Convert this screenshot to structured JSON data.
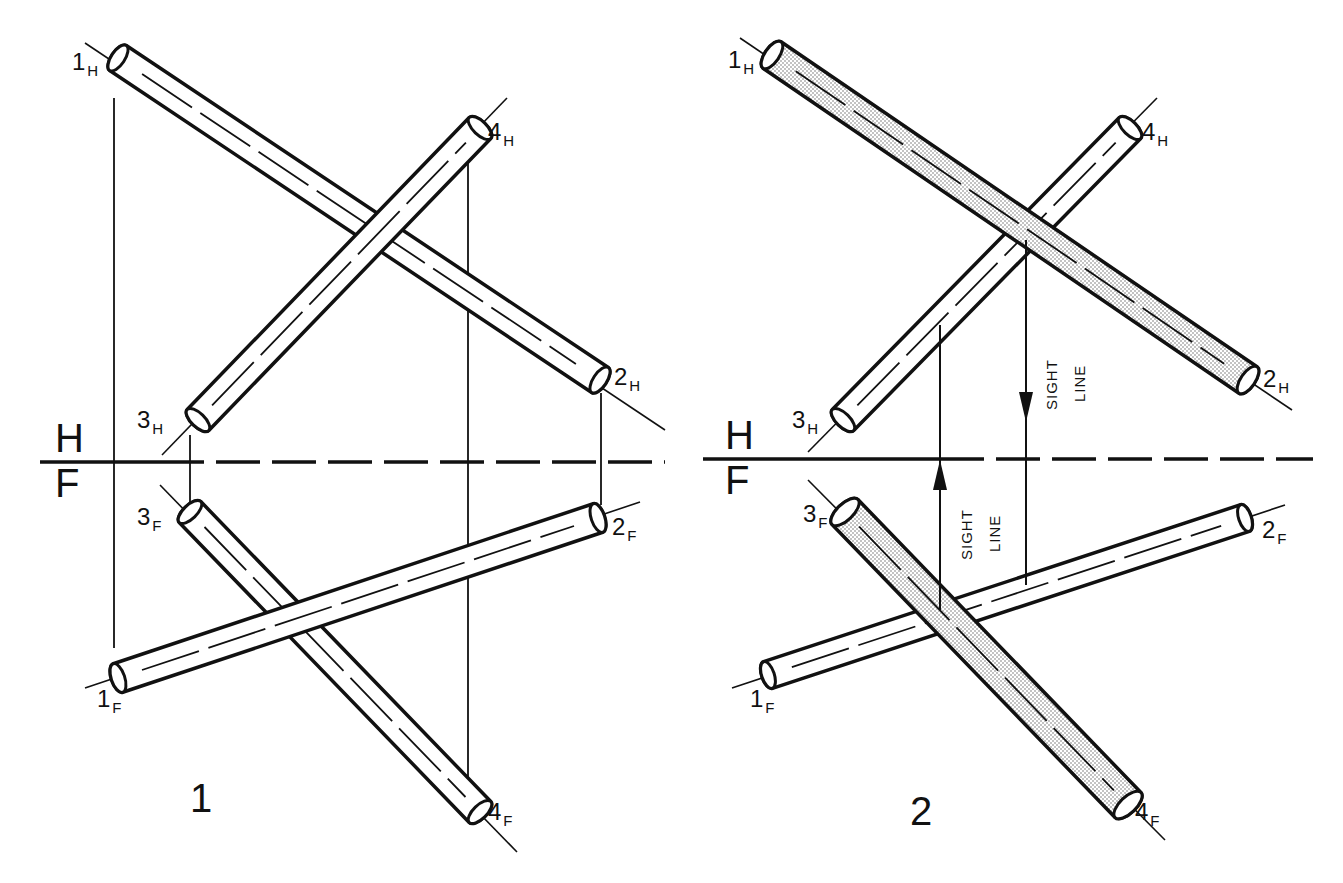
{
  "diagram": {
    "colors": {
      "ink": "#111111",
      "shade": "#d8d8d8",
      "background": "#ffffff"
    },
    "folding_line": {
      "upper_label": "H",
      "lower_label": "F"
    },
    "figures": [
      {
        "id": "fig1",
        "label": "1",
        "label_pos": [
          190,
          812
        ],
        "hf_line": {
          "x1": 40,
          "x2": 665,
          "y": 462,
          "dashed_from": 160
        },
        "hf_label_pos": {
          "H": [
            55,
            452
          ],
          "F": [
            55,
            497
          ]
        },
        "pipes": [
          {
            "name": "pipe-1-2-H",
            "from": [
              118,
              58
            ],
            "to": [
              600,
              380
            ],
            "radius": 15,
            "shaded": false,
            "ext": [
              [
                85,
                43
              ],
              [
                665,
                430
              ]
            ]
          },
          {
            "name": "pipe-3-4-H",
            "from": [
              198,
              420
            ],
            "to": [
              480,
              128
            ],
            "radius": 15,
            "shaded": false,
            "ext": [
              [
                162,
                455
              ],
              [
                507,
                98
              ]
            ]
          },
          {
            "name": "pipe-3-4-F",
            "from": [
              190,
              512
            ],
            "to": [
              480,
              812
            ],
            "radius": 15,
            "shaded": false,
            "ext": [
              [
                160,
                485
              ],
              [
                517,
                852
              ]
            ]
          },
          {
            "name": "pipe-1-2-F",
            "from": [
              118,
              678
            ],
            "to": [
              598,
              518
            ],
            "radius": 15,
            "shaded": false,
            "ext": [
              [
                85,
                688
              ],
              [
                640,
                502
              ]
            ]
          }
        ],
        "projectors": [
          {
            "x": 114,
            "y1": 98,
            "y2": 648
          },
          {
            "x": 190,
            "y1": 435,
            "y2": 505
          },
          {
            "x": 601,
            "y1": 393,
            "y2": 505
          },
          {
            "x": 468,
            "y1": 140,
            "y2": 800
          }
        ],
        "labels": [
          {
            "num": "1",
            "sub": "H",
            "pos": [
              72,
              70
            ]
          },
          {
            "num": "4",
            "sub": "H",
            "pos": [
              488,
              140
            ]
          },
          {
            "num": "2",
            "sub": "H",
            "pos": [
              614,
              385
            ]
          },
          {
            "num": "3",
            "sub": "H",
            "pos": [
              137,
              428
            ]
          },
          {
            "num": "3",
            "sub": "F",
            "pos": [
              137,
              525
            ]
          },
          {
            "num": "2",
            "sub": "F",
            "pos": [
              612,
              535
            ]
          },
          {
            "num": "1",
            "sub": "F",
            "pos": [
              97,
              707
            ]
          },
          {
            "num": "4",
            "sub": "F",
            "pos": [
              488,
              820
            ]
          }
        ]
      },
      {
        "id": "fig2",
        "label": "2",
        "label_pos": [
          910,
          825
        ],
        "hf_line": {
          "x1": 703,
          "x2": 1313,
          "y": 459,
          "dashed_from": 940
        },
        "hf_label_pos": {
          "H": [
            725,
            449
          ],
          "F": [
            725,
            494
          ]
        },
        "pipes": [
          {
            "name": "pipe-3-4-H",
            "from": [
              843,
              420
            ],
            "to": [
              1130,
              128
            ],
            "radius": 15,
            "shaded": false,
            "ext": [
              [
                808,
                452
              ],
              [
                1157,
                98
              ]
            ]
          },
          {
            "name": "pipe-1-2-H",
            "from": [
              772,
              55
            ],
            "to": [
              1248,
              380
            ],
            "radius": 16,
            "shaded": true,
            "ext": [
              [
                740,
                38
              ],
              [
                1292,
                410
              ]
            ]
          },
          {
            "name": "pipe-1-2-F",
            "from": [
              768,
              675
            ],
            "to": [
              1245,
              518
            ],
            "radius": 14,
            "shaded": false,
            "ext": [
              [
                732,
                688
              ],
              [
                1285,
                505
              ]
            ]
          },
          {
            "name": "pipe-3-4-F",
            "from": [
              845,
              512
            ],
            "to": [
              1128,
              805
            ],
            "radius": 18,
            "shaded": true,
            "ext": [
              [
                808,
                480
              ],
              [
                1165,
                840
              ]
            ]
          }
        ],
        "sight_lines": [
          {
            "x": 940,
            "y1": 610,
            "y2": 325,
            "arrow_at": 482,
            "dir": "up",
            "text1": "SIGHT",
            "text2": "LINE",
            "text_pos": [
              972,
              560
            ]
          },
          {
            "x": 1026,
            "y1": 240,
            "y2": 585,
            "arrow_at": 400,
            "dir": "down",
            "text1": "SIGHT",
            "text2": "LINE",
            "text_pos": [
              1057,
              410
            ]
          }
        ],
        "labels": [
          {
            "num": "1",
            "sub": "H",
            "pos": [
              728,
              68
            ]
          },
          {
            "num": "4",
            "sub": "H",
            "pos": [
              1142,
              140
            ]
          },
          {
            "num": "2",
            "sub": "H",
            "pos": [
              1263,
              387
            ]
          },
          {
            "num": "3",
            "sub": "H",
            "pos": [
              792,
              428
            ]
          },
          {
            "num": "3",
            "sub": "F",
            "pos": [
              803,
              522
            ]
          },
          {
            "num": "2",
            "sub": "F",
            "pos": [
              1262,
              538
            ]
          },
          {
            "num": "1",
            "sub": "F",
            "pos": [
              750,
              707
            ]
          },
          {
            "num": "4",
            "sub": "F",
            "pos": [
              1135,
              820
            ]
          }
        ]
      }
    ]
  }
}
